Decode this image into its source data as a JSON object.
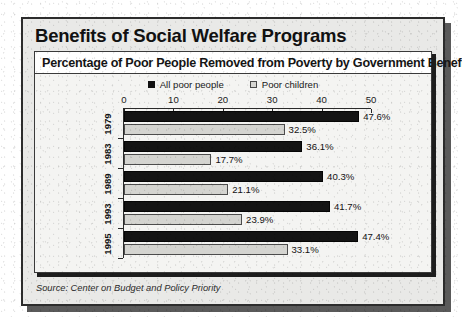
{
  "headline": "Benefits of Social Welfare Programs",
  "subtitle": "Percentage of Poor People Removed from Poverty by Government Benefits",
  "source": "Source: Center on Budget and Policy Priority",
  "legend": [
    {
      "label": "All poor people",
      "swatch": "dark",
      "color": "#141414"
    },
    {
      "label": "Poor children",
      "swatch": "light",
      "color": "#d4d4d0"
    }
  ],
  "chart_data": {
    "type": "bar",
    "orientation": "horizontal",
    "title": "Percentage of Poor People Removed from Poverty by Government Benefits",
    "subtitle": "Benefits of Social Welfare Programs",
    "xlabel": "",
    "ylabel": "",
    "xlim": [
      0,
      50
    ],
    "xticks": [
      0,
      10,
      20,
      30,
      40,
      50
    ],
    "xticklabels": [
      "0",
      "10",
      "20",
      "30",
      "40",
      "50"
    ],
    "grid": false,
    "legend_position": "top-center",
    "value_suffix": "%",
    "categories": [
      "1979",
      "1983",
      "1989",
      "1993",
      "1995"
    ],
    "series": [
      {
        "name": "All poor people",
        "color": "#141414",
        "values": [
          47.6,
          36.1,
          40.3,
          41.7,
          47.4
        ],
        "labels": [
          "47.6%",
          "36.1%",
          "40.3%",
          "41.7%",
          "47.4%"
        ]
      },
      {
        "name": "Poor children",
        "color": "#d4d4d0",
        "values": [
          32.5,
          17.7,
          21.1,
          23.9,
          33.1
        ],
        "labels": [
          "32.5%",
          "17.7%",
          "21.1%",
          "23.9%",
          "33.1%"
        ]
      }
    ],
    "source": "Source: Center on Budget and Policy Priority"
  }
}
